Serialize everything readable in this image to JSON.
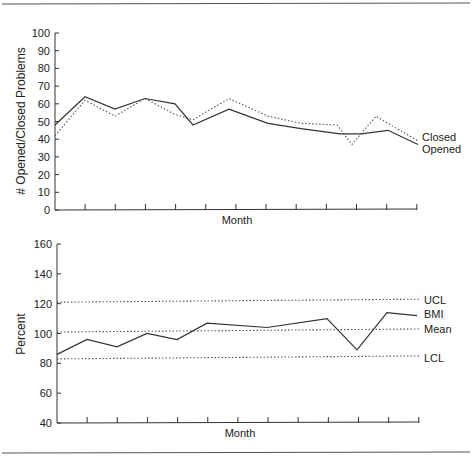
{
  "chart_data": [
    {
      "type": "line",
      "title": "",
      "xlabel": "Month",
      "ylabel": "# Opened/Closed Problems",
      "ylim": [
        0,
        100
      ],
      "yticks": [
        0,
        10,
        20,
        30,
        40,
        50,
        60,
        70,
        80,
        90,
        100
      ],
      "x_tick_count": 13,
      "grid": false,
      "legend_position": "right, inline labels",
      "series": [
        {
          "name": "Closed",
          "style": "dotted",
          "x": [
            0,
            1,
            2,
            3,
            4,
            4.6,
            5.8,
            7.1,
            8.2,
            9.4,
            9.9,
            10.7,
            12.1
          ],
          "values": [
            42,
            62,
            53,
            63,
            54,
            51,
            63,
            53,
            49,
            48,
            37,
            53,
            39
          ]
        },
        {
          "name": "Opened",
          "style": "solid",
          "x": [
            0,
            1,
            2,
            3,
            4,
            4.6,
            5.8,
            7.1,
            8.2,
            9.5,
            10.2,
            11.1,
            12.1
          ],
          "values": [
            48,
            64,
            57,
            63,
            60,
            48,
            57,
            49,
            46,
            43,
            43,
            45,
            37
          ]
        }
      ]
    },
    {
      "type": "line",
      "title": "",
      "xlabel": "Month",
      "ylabel": "Percent",
      "ylim": [
        40,
        160
      ],
      "yticks": [
        40,
        60,
        80,
        100,
        120,
        140,
        160
      ],
      "x_tick_count": 13,
      "grid": false,
      "legend_position": "right, inline labels",
      "series": [
        {
          "name": "UCL",
          "style": "dotted",
          "x": [
            0,
            12.1
          ],
          "values": [
            121,
            123
          ]
        },
        {
          "name": "BMI",
          "style": "solid",
          "x": [
            0,
            1,
            2,
            3,
            4,
            5,
            7,
            9,
            10,
            11,
            12
          ],
          "values": [
            86,
            96,
            91,
            100,
            96,
            107,
            104,
            110,
            89,
            114,
            112
          ]
        },
        {
          "name": "Mean",
          "style": "dotted",
          "x": [
            0,
            12.1
          ],
          "values": [
            101,
            103
          ]
        },
        {
          "name": "LCL",
          "style": "dotted",
          "x": [
            0,
            12.1
          ],
          "values": [
            83,
            85
          ]
        }
      ]
    }
  ],
  "top_chart": {
    "ylabel": "# Opened/Closed Problems",
    "xlabel": "Month",
    "ytick_labels": [
      "0",
      "10",
      "20",
      "30",
      "40",
      "50",
      "60",
      "70",
      "80",
      "90",
      "100"
    ],
    "legend": {
      "closed": "Closed",
      "opened": "Opened"
    }
  },
  "bottom_chart": {
    "ylabel": "Percent",
    "xlabel": "Month",
    "ytick_labels": [
      "40",
      "60",
      "80",
      "100",
      "120",
      "140",
      "160"
    ],
    "legend": {
      "ucl": "UCL",
      "bmi": "BMI",
      "mean": "Mean",
      "lcl": "LCL"
    }
  }
}
